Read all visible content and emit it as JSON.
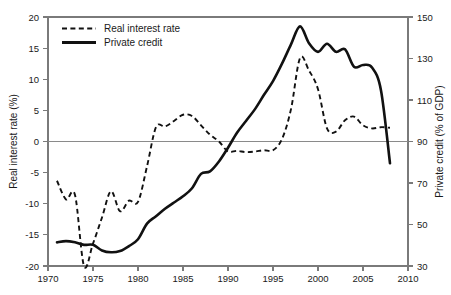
{
  "chart_data": {
    "type": "line",
    "title": "",
    "xlabel": "",
    "ylabel": "Real interest rate (%)",
    "y2label": "Private credit (% of GDP)",
    "grid": false,
    "legend_position": "top-left",
    "xlim": [
      1970,
      2010
    ],
    "ylim": [
      -20,
      20
    ],
    "y2lim": [
      30,
      150
    ],
    "xticks": [
      "1970",
      "1975",
      "1980",
      "1985",
      "1990",
      "1995",
      "2000",
      "2005",
      "2010"
    ],
    "xtick_values": [
      1970,
      1975,
      1980,
      1985,
      1990,
      1995,
      2000,
      2005,
      2010
    ],
    "yticks": [
      "20",
      "15",
      "10",
      "5",
      "0",
      "-5",
      "-10",
      "-15",
      "-20"
    ],
    "ytick_values": [
      20,
      15,
      10,
      5,
      0,
      -5,
      -10,
      -15,
      -20
    ],
    "y2ticks": [
      "150",
      "130",
      "110",
      "90",
      "70",
      "50",
      "30"
    ],
    "y2tick_values": [
      150,
      130,
      110,
      90,
      70,
      50,
      30
    ],
    "zero_reference_line": 0,
    "series": [
      {
        "name": "Real interest rate",
        "axis": "left",
        "style": "dashed",
        "color": "#111111",
        "unit": "%",
        "x": [
          1971,
          1972,
          1973,
          1974,
          1975,
          1976,
          1977,
          1978,
          1979,
          1980,
          1981,
          1982,
          1983,
          1984,
          1985,
          1986,
          1987,
          1988,
          1989,
          1990,
          1991,
          1992,
          1993,
          1994,
          1995,
          1996,
          1997,
          1998,
          1999,
          2000,
          2001,
          2002,
          2003,
          2004,
          2005,
          2006,
          2007,
          2008
        ],
        "values": [
          -6.3,
          -9.3,
          -8.6,
          -20.0,
          -16.4,
          -12.2,
          -8.0,
          -11.2,
          -9.5,
          -9.7,
          -4.0,
          2.3,
          2.4,
          3.3,
          4.3,
          4.1,
          2.6,
          1.1,
          0.0,
          -1.6,
          -1.5,
          -1.7,
          -1.6,
          -1.4,
          -1.4,
          0.4,
          5.2,
          13.4,
          11.4,
          8.4,
          2.1,
          1.6,
          3.4,
          4.0,
          2.6,
          2.1,
          2.3,
          2.2
        ]
      },
      {
        "name": "Private credit",
        "axis": "right",
        "style": "solid",
        "color": "#111111",
        "unit": "% of GDP",
        "x": [
          1971,
          1972,
          1973,
          1974,
          1975,
          1976,
          1977,
          1978,
          1979,
          1980,
          1981,
          1982,
          1983,
          1984,
          1985,
          1986,
          1987,
          1988,
          1989,
          1990,
          1991,
          1992,
          1993,
          1994,
          1995,
          1996,
          1997,
          1998,
          1999,
          2000,
          2001,
          2002,
          2003,
          2004,
          2005,
          2006,
          2007,
          2008
        ],
        "values_left_scale": [
          -16.2,
          -16.0,
          -16.2,
          -16.6,
          -16.6,
          -17.5,
          -17.8,
          -17.6,
          -16.8,
          -15.7,
          -13.2,
          -12.0,
          -10.8,
          -9.8,
          -8.8,
          -7.5,
          -5.2,
          -4.8,
          -3.2,
          -1.0,
          1.4,
          3.3,
          5.2,
          7.5,
          9.7,
          12.5,
          15.6,
          18.5,
          15.8,
          14.4,
          15.7,
          14.4,
          14.8,
          12.0,
          12.3,
          11.9,
          8.2,
          -3.5
        ],
        "values": [
          41,
          42,
          41,
          40,
          40,
          37,
          36,
          37,
          40,
          43,
          50,
          54,
          58,
          61,
          64,
          68,
          74,
          76,
          80,
          87,
          94,
          100,
          106,
          113,
          119,
          128,
          137,
          146,
          137,
          133,
          137,
          133,
          134,
          126,
          127,
          126,
          115,
          79
        ]
      }
    ],
    "legend": [
      {
        "label": "Real interest rate",
        "style": "dashed"
      },
      {
        "label": "Private credit",
        "style": "solid"
      }
    ]
  },
  "axes": {
    "left_title": "Real interest rate (%)",
    "right_title": "Private credit (% of GDP)",
    "x_labels": [
      "1970",
      "1975",
      "1980",
      "1985",
      "1990",
      "1995",
      "2000",
      "2005",
      "2010"
    ],
    "left_labels": [
      "20",
      "15",
      "10",
      "5",
      "0",
      "-5",
      "-10",
      "-15",
      "-20"
    ],
    "right_labels": [
      "150",
      "130",
      "110",
      "90",
      "70",
      "50",
      "30"
    ]
  },
  "legend": {
    "entry_0_label": "Real interest rate",
    "entry_1_label": "Private credit"
  },
  "caption": {
    "text": ""
  }
}
